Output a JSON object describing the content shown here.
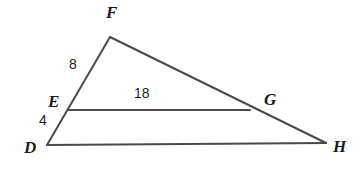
{
  "figure": {
    "background_color": "#ffffff",
    "stroke_color": "#4a4a4a",
    "stroke_width": 2,
    "label_color": "#1a1a1a",
    "width": 360,
    "height": 178
  },
  "points": {
    "D": {
      "label": "D",
      "x": 47,
      "y": 145,
      "label_x": 24,
      "label_y": 139
    },
    "E": {
      "label": "E",
      "x": 68,
      "y": 110,
      "label_x": 48,
      "label_y": 93
    },
    "F": {
      "label": "F",
      "x": 110,
      "y": 37,
      "label_x": 106,
      "label_y": 4
    },
    "G": {
      "label": "G",
      "x": 250,
      "y": 110,
      "label_x": 264,
      "label_y": 91
    },
    "H": {
      "label": "H",
      "x": 326,
      "y": 143,
      "label_x": 333,
      "label_y": 138
    }
  },
  "segments": [
    {
      "name": "segment-DF",
      "from": "D",
      "to": "F"
    },
    {
      "name": "segment-FH",
      "from": "F",
      "to": "H"
    },
    {
      "name": "segment-DH",
      "from": "D",
      "to": "H"
    },
    {
      "name": "segment-EG",
      "from": "E",
      "to": "G"
    }
  ],
  "measures": {
    "EF": {
      "value": "8",
      "x": 69,
      "y": 57,
      "on_segment": "EF"
    },
    "DE": {
      "value": "4",
      "x": 39,
      "y": 113,
      "on_segment": "DE"
    },
    "EG": {
      "value": "18",
      "x": 134,
      "y": 86,
      "on_segment": "EG"
    }
  }
}
